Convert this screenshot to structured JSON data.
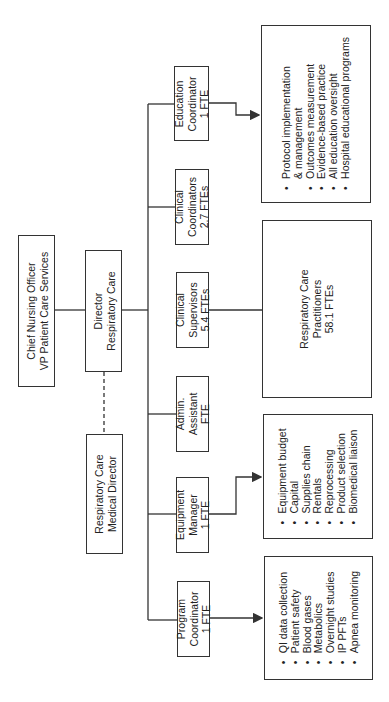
{
  "chart": {
    "orientation": "rotated-90-ccw",
    "nodes": {
      "cno": {
        "lines": [
          "Chief Nursing Officer",
          "VP Patient Care Services"
        ]
      },
      "director": {
        "lines": [
          "Director",
          "Respiratory Care"
        ]
      },
      "medical_director": {
        "lines": [
          "Respiratory Care",
          "Medical Director"
        ]
      },
      "education": {
        "lines": [
          "Education",
          "Coordinator",
          "1 FTE"
        ]
      },
      "clinical_coordinators": {
        "lines": [
          "Clinical",
          "Coordinators",
          "2.7 FTEs"
        ]
      },
      "clinical_supervisors": {
        "lines": [
          "Clinical",
          "Supervisors",
          "5.4 FTEs"
        ]
      },
      "admin_assistant": {
        "lines": [
          "Admin.",
          "Assistant",
          "FTE"
        ]
      },
      "equipment_manager": {
        "lines": [
          "Equipment",
          "Manager",
          "1 FTE"
        ]
      },
      "program_coordinator": {
        "lines": [
          "Program",
          "Coordinator",
          "1 FTE"
        ]
      },
      "practitioners": {
        "lines": [
          "Respiratory Care",
          "Practitioners",
          "58.1 FTEs"
        ]
      }
    },
    "lists": {
      "education": [
        {
          "text": "Protocol implementation",
          "bullet": true
        },
        {
          "text": "& management",
          "bullet": false
        },
        {
          "text": "Outcomes measurement",
          "bullet": true
        },
        {
          "text": "Evidence-based practice",
          "bullet": true
        },
        {
          "text": "All education oversight",
          "bullet": true
        },
        {
          "text": "Hospital educational programs",
          "bullet": true
        }
      ],
      "equipment": [
        {
          "text": "Equipment budget",
          "bullet": true
        },
        {
          "text": "Capital",
          "bullet": true
        },
        {
          "text": "Supplies chain",
          "bullet": true
        },
        {
          "text": "Rentals",
          "bullet": true
        },
        {
          "text": "Reprocessing",
          "bullet": true
        },
        {
          "text": "Product selection",
          "bullet": true
        },
        {
          "text": "Biomedical liaison",
          "bullet": true
        }
      ],
      "program": [
        {
          "text": "QI data collection",
          "bullet": true
        },
        {
          "text": "Patient safety",
          "bullet": true
        },
        {
          "text": "Blood gases",
          "bullet": true
        },
        {
          "text": "Metabolics",
          "bullet": true
        },
        {
          "text": "Overnight studies",
          "bullet": true
        },
        {
          "text": "IP PFTs",
          "bullet": true
        },
        {
          "text": "Apnea monitoring",
          "bullet": true
        }
      ]
    },
    "colors": {
      "line": "#333333",
      "background": "#ffffff",
      "text": "#222222"
    }
  }
}
